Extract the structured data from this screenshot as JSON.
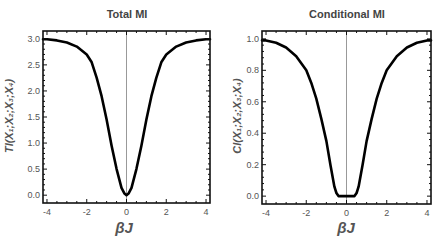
{
  "chart_data": [
    {
      "type": "line",
      "title": "Total  MI",
      "xlabel": "βJ",
      "ylabel": "TI(X₁;X₂;X₃;X₄)",
      "xlim": [
        -4.2,
        4.2
      ],
      "ylim": [
        -0.15,
        3.15
      ],
      "xticks": [
        -4,
        -2,
        0,
        2,
        4
      ],
      "xtick_labels": [
        "-4",
        "-2",
        "0",
        "2",
        "4"
      ],
      "yticks": [
        0.0,
        0.5,
        1.0,
        1.5,
        2.0,
        2.5,
        3.0
      ],
      "ytick_labels": [
        "0.0",
        "0.5",
        "1.0",
        "1.5",
        "2.0",
        "2.5",
        "3.0"
      ],
      "grid": false,
      "vertical_reference_line_x": 0,
      "series": [
        {
          "name": "TI",
          "color": "#000000",
          "x": [
            -4.2,
            -4,
            -3.5,
            -3,
            -2.5,
            -2,
            -1.75,
            -1.5,
            -1.25,
            -1,
            -0.75,
            -0.5,
            -0.25,
            -0.1,
            0,
            0.1,
            0.25,
            0.5,
            0.75,
            1,
            1.25,
            1.5,
            1.75,
            2,
            2.5,
            3,
            3.5,
            4,
            4.2
          ],
          "y": [
            2.99,
            2.99,
            2.97,
            2.93,
            2.85,
            2.7,
            2.55,
            2.25,
            1.9,
            1.45,
            0.95,
            0.5,
            0.14,
            0.03,
            0.0,
            0.03,
            0.14,
            0.5,
            0.95,
            1.45,
            1.9,
            2.25,
            2.55,
            2.7,
            2.85,
            2.93,
            2.97,
            2.99,
            2.99
          ]
        }
      ]
    },
    {
      "type": "line",
      "title": "Conditional MI",
      "xlabel": "βJ",
      "ylabel": "CI(X₁;X₂;X₃;X₄)",
      "xlim": [
        -4.2,
        4.2
      ],
      "ylim": [
        -0.05,
        1.05
      ],
      "xticks": [
        -4,
        -2,
        0,
        2,
        4
      ],
      "xtick_labels": [
        "-4",
        "-2",
        "0",
        "2",
        "4"
      ],
      "yticks": [
        0.0,
        0.2,
        0.4,
        0.6,
        0.8,
        1.0
      ],
      "ytick_labels": [
        "0.0",
        "0.2",
        "0.4",
        "0.6",
        "0.8",
        "1.0"
      ],
      "grid": false,
      "vertical_reference_line_x": 0,
      "series": [
        {
          "name": "CI",
          "color": "#000000",
          "x": [
            -4.2,
            -4,
            -3.5,
            -3,
            -2.5,
            -2,
            -1.75,
            -1.5,
            -1.25,
            -1,
            -0.8,
            -0.6,
            -0.5,
            -0.4,
            -0.2,
            0,
            0.2,
            0.4,
            0.5,
            0.6,
            0.8,
            1,
            1.25,
            1.5,
            1.75,
            2,
            2.5,
            3,
            3.5,
            4,
            4.2
          ],
          "y": [
            0.99,
            0.99,
            0.975,
            0.945,
            0.89,
            0.8,
            0.72,
            0.62,
            0.49,
            0.35,
            0.2,
            0.06,
            0.02,
            0.0,
            0.0,
            0.0,
            0.0,
            0.0,
            0.02,
            0.06,
            0.2,
            0.35,
            0.49,
            0.62,
            0.72,
            0.8,
            0.89,
            0.945,
            0.975,
            0.99,
            0.99
          ]
        }
      ]
    }
  ]
}
